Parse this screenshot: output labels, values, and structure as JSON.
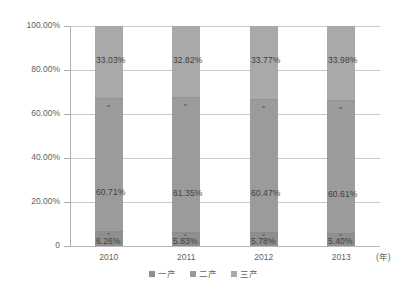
{
  "chart_data": {
    "type": "bar",
    "subtype": "100% stacked column",
    "title": "",
    "subtitle": "",
    "xlabel": "(年)",
    "ylabel": "",
    "categories": [
      "2010",
      "2011",
      "2012",
      "2013"
    ],
    "ylim": [
      0,
      100
    ],
    "ytick_labels": [
      "100.00%",
      "80.00%",
      "60.00%",
      "40.00%",
      "20.00%",
      "0"
    ],
    "ytick_values": [
      100,
      80,
      60,
      40,
      20,
      0
    ],
    "grid": true,
    "legend_position": "bottom-center",
    "series": [
      {
        "name": "一产",
        "color": "#8f8f8f",
        "values": [
          6.26,
          5.83,
          5.78,
          5.4
        ],
        "labels": [
          "6.26%",
          "5.83%",
          "5.78%",
          "5.40%"
        ]
      },
      {
        "name": "二产",
        "color": "#9b9b9b",
        "values": [
          60.71,
          61.35,
          60.47,
          60.61
        ],
        "labels": [
          "60.71%",
          "61.35%",
          "60.47%",
          "60.61%"
        ]
      },
      {
        "name": "三产",
        "color": "#a9a9a9",
        "values": [
          33.03,
          32.82,
          33.77,
          33.98
        ],
        "labels": [
          "33.03%",
          "32.82%",
          "33.77%",
          "33.98%"
        ]
      }
    ]
  },
  "axis": {
    "y_ticks": [
      {
        "label": "100.00%"
      },
      {
        "label": "80.00%"
      },
      {
        "label": "60.00%"
      },
      {
        "label": "40.00%"
      },
      {
        "label": "20.00%"
      },
      {
        "label": "0"
      }
    ],
    "x_ticks": [
      {
        "label": "2010"
      },
      {
        "label": "2011"
      },
      {
        "label": "2012"
      },
      {
        "label": "2013"
      }
    ],
    "x_unit": "(年)"
  },
  "legend": {
    "items": [
      {
        "label": "一产",
        "color": "#8f8f8f"
      },
      {
        "label": "二产",
        "color": "#9b9b9b"
      },
      {
        "label": "三产",
        "color": "#a9a9a9"
      }
    ]
  },
  "colors": {
    "primary_industry": "#8f8f8f",
    "secondary_industry": "#9b9b9b",
    "tertiary_industry": "#a9a9a9",
    "gridline": "#c9c9c9",
    "axis": "#b0b0b0",
    "text": "#5f5f5f",
    "background": "#ffffff"
  }
}
